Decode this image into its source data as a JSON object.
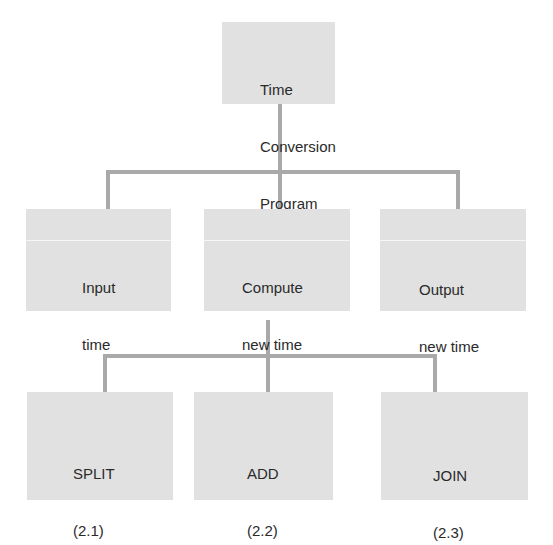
{
  "diagram": {
    "colors": {
      "box_fill": "#e1e1e1",
      "connector": "#a9a9a9",
      "text": "#2a2a2a",
      "background": "#ffffff"
    },
    "root": {
      "lines": [
        "Time",
        "Conversion",
        "Program"
      ]
    },
    "level1": [
      {
        "lines": [
          "Input",
          "time",
          "(1)"
        ]
      },
      {
        "lines": [
          "Compute",
          "new time",
          "(2)"
        ]
      },
      {
        "lines": [
          "Output",
          "new time",
          "(3)"
        ]
      }
    ],
    "level2": [
      {
        "lines": [
          "SPLIT",
          "(2.1)"
        ]
      },
      {
        "lines": [
          "ADD",
          "(2.2)"
        ]
      },
      {
        "lines": [
          "JOIN",
          "(2.3)"
        ]
      }
    ]
  }
}
